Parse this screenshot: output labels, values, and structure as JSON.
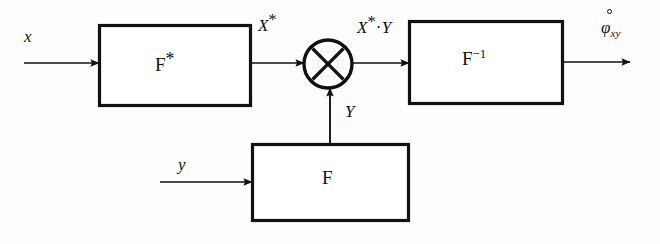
{
  "diagram": {
    "background_color": "#fefefe",
    "stroke_color": "#111111",
    "blocks": [
      {
        "id": "f-star",
        "label_main": "F",
        "label_sup": "*",
        "role": "forward-conjugate-fourier-transform"
      },
      {
        "id": "f-inverse",
        "label_main": "F",
        "label_sup": "−1",
        "role": "inverse-fourier-transform"
      },
      {
        "id": "f-forward",
        "label_main": "F",
        "label_sup": "",
        "role": "forward-fourier-transform"
      }
    ],
    "multiplier": {
      "id": "multiplier",
      "glyph": "×",
      "role": "multiply-node"
    },
    "signals": {
      "input_x": "x",
      "input_y": "y",
      "after_fstar_main": "X",
      "after_fstar_sup": "*",
      "product_main": "X",
      "product_sup": "*",
      "product_dot": "·",
      "product_second": "Y",
      "branch_y": "Y",
      "output_main": "φ",
      "output_sub": "xy",
      "output_accent": "ring"
    }
  }
}
